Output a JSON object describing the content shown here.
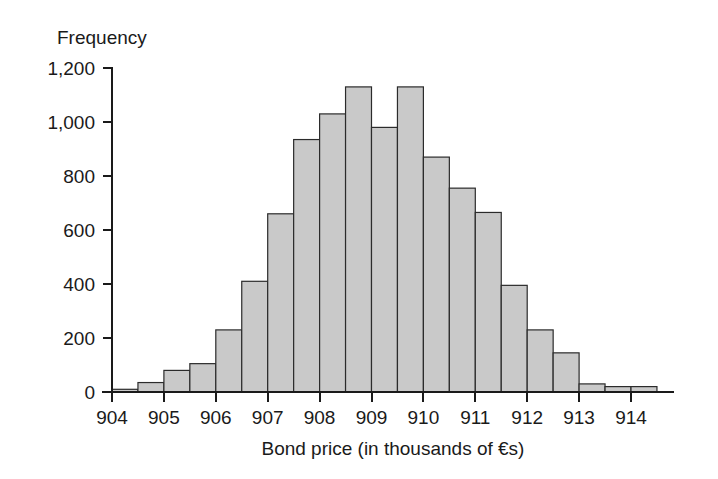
{
  "chart_data": {
    "type": "bar",
    "title": "",
    "subtitle": "",
    "xlabel": "Bond price (in thousands of €s)",
    "ylabel": "Frequency",
    "xlim": [
      903.75,
      914.75
    ],
    "ylim": [
      0,
      1240
    ],
    "grid": false,
    "legend": null,
    "bin_width": 0.5,
    "x_tick_labels": [
      "904",
      "905",
      "906",
      "907",
      "908",
      "909",
      "910",
      "911",
      "912",
      "913",
      "914"
    ],
    "x_tick_values": [
      904,
      905,
      906,
      907,
      908,
      909,
      910,
      911,
      912,
      913,
      914
    ],
    "y_tick_labels": [
      "0",
      "200",
      "400",
      "600",
      "800",
      "1,000",
      "1,200"
    ],
    "y_tick_values": [
      0,
      200,
      400,
      600,
      800,
      1000,
      1200
    ],
    "bins": [
      {
        "left": 904.0,
        "right": 904.5,
        "value": 10
      },
      {
        "left": 904.5,
        "right": 905.0,
        "value": 35
      },
      {
        "left": 905.0,
        "right": 905.5,
        "value": 80
      },
      {
        "left": 905.5,
        "right": 906.0,
        "value": 105
      },
      {
        "left": 906.0,
        "right": 906.5,
        "value": 230
      },
      {
        "left": 906.5,
        "right": 907.0,
        "value": 410
      },
      {
        "left": 907.0,
        "right": 907.5,
        "value": 660
      },
      {
        "left": 907.5,
        "right": 908.0,
        "value": 935
      },
      {
        "left": 908.0,
        "right": 908.5,
        "value": 1030
      },
      {
        "left": 908.5,
        "right": 909.0,
        "value": 1130
      },
      {
        "left": 909.0,
        "right": 909.5,
        "value": 980
      },
      {
        "left": 909.5,
        "right": 910.0,
        "value": 1130
      },
      {
        "left": 910.0,
        "right": 910.5,
        "value": 870
      },
      {
        "left": 910.5,
        "right": 911.0,
        "value": 755
      },
      {
        "left": 911.0,
        "right": 911.5,
        "value": 665
      },
      {
        "left": 911.5,
        "right": 912.0,
        "value": 395
      },
      {
        "left": 912.0,
        "right": 912.5,
        "value": 230
      },
      {
        "left": 912.5,
        "right": 913.0,
        "value": 145
      },
      {
        "left": 913.0,
        "right": 913.5,
        "value": 30
      },
      {
        "left": 913.5,
        "right": 914.0,
        "value": 20
      },
      {
        "left": 914.0,
        "right": 914.5,
        "value": 20
      }
    ],
    "colors": {
      "bar_fill": "#c9c9c9",
      "bar_stroke": "#2b2b2b",
      "axis": "#1a1a1a",
      "text": "#1a1a1a",
      "background": "#ffffff"
    }
  }
}
